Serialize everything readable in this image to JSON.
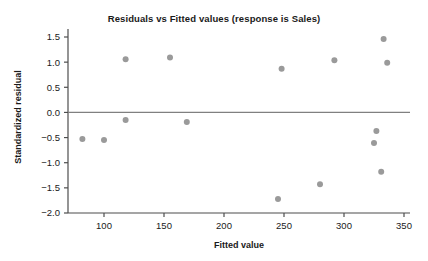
{
  "chart_data": {
    "type": "scatter",
    "title": "Residuals vs Fitted values (response is Sales)",
    "xlabel": "Fitted value",
    "ylabel": "Standardized residual",
    "xlim": [
      70,
      355
    ],
    "ylim": [
      -2.0,
      1.5
    ],
    "xticks": [
      100,
      150,
      200,
      250,
      300,
      350
    ],
    "xtick_labels": [
      "100",
      "150",
      "200",
      "250",
      "300",
      "350"
    ],
    "yticks": [
      1.5,
      1.0,
      0.5,
      0.0,
      -0.5,
      -1.0,
      -1.5,
      -2.0
    ],
    "ytick_labels": [
      "1.5",
      "1.0",
      "0.5",
      "0.0",
      "-0.5",
      "-1.0",
      "-1.5",
      "-2.0"
    ],
    "grid": false,
    "legend": null,
    "reference_line": {
      "orientation": "horizontal",
      "value": 0.0,
      "color": "#808080"
    },
    "marker": {
      "shape": "circle",
      "color": "#9a9a9a",
      "radius": 3.0
    },
    "points": [
      {
        "x": 82,
        "y": -0.53
      },
      {
        "x": 100,
        "y": -0.55
      },
      {
        "x": 118,
        "y": 1.06
      },
      {
        "x": 118,
        "y": -0.15
      },
      {
        "x": 155,
        "y": 1.09
      },
      {
        "x": 169,
        "y": -0.19
      },
      {
        "x": 245,
        "y": -1.72
      },
      {
        "x": 248,
        "y": 0.87
      },
      {
        "x": 280,
        "y": -1.43
      },
      {
        "x": 292,
        "y": 1.04
      },
      {
        "x": 325,
        "y": -0.61
      },
      {
        "x": 327,
        "y": -0.37
      },
      {
        "x": 331,
        "y": -1.18
      },
      {
        "x": 333,
        "y": 1.46
      },
      {
        "x": 336,
        "y": 0.99
      }
    ]
  },
  "axes": {
    "x_axis_color": "#4d4d4d",
    "y_axis_color": "#4d4d4d"
  }
}
